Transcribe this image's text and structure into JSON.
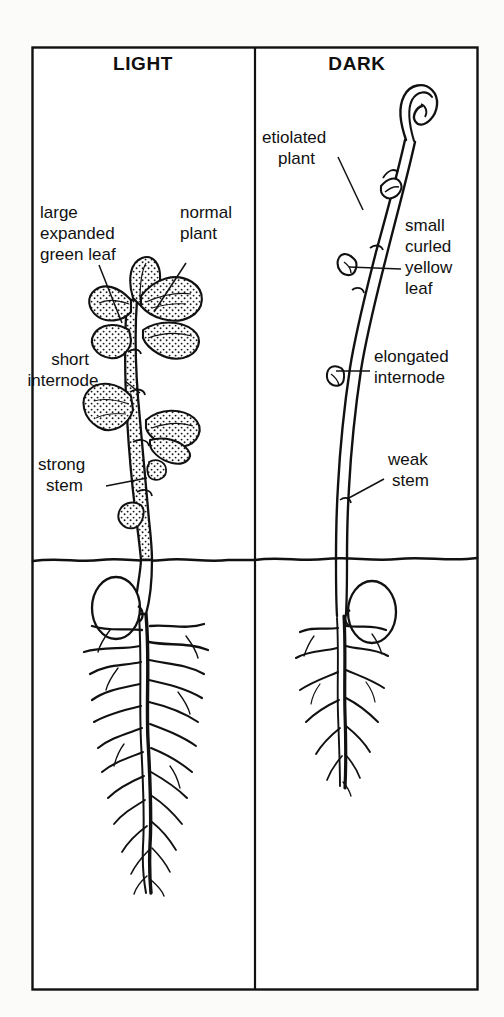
{
  "figure": {
    "background_color": "#fbfbfa",
    "ink_color": "#111111",
    "frame": {
      "x": 32,
      "y": 47,
      "width": 446,
      "height": 943
    },
    "divider_x": 255,
    "soil_line_y": 560
  },
  "panels": [
    {
      "id": "light",
      "header": "LIGHT",
      "header_x": 143,
      "header_y": 70,
      "plant_description": "normal green seedling with expanded leaves, short internodes, thick stem and extensive root system"
    },
    {
      "id": "dark",
      "header": "DARK",
      "header_x": 357,
      "header_y": 70,
      "plant_description": "etiolated seedling with apical hook, small curled leaves, elongated internodes, weak thin stem and reduced root system"
    }
  ],
  "labels": {
    "light": [
      {
        "name": "large-expanded-green-leaf",
        "lines": [
          "large",
          "expanded",
          "green leaf"
        ],
        "x": 40,
        "y": 218,
        "leader": {
          "x1": 99,
          "y1": 265,
          "x2": 122,
          "y2": 323
        }
      },
      {
        "name": "normal-plant",
        "lines": [
          "normal",
          "plant"
        ],
        "x": 180,
        "y": 218,
        "leader": {
          "x1": 186,
          "y1": 265,
          "x2": 154,
          "y2": 310
        }
      },
      {
        "name": "short-internode",
        "lines": [
          "short",
          "internode"
        ],
        "x": 34,
        "y": 365,
        "leader": {
          "x1": 126,
          "y1": 378,
          "x2": 142,
          "y2": 390
        }
      },
      {
        "name": "strong-stem",
        "lines": [
          "strong",
          "stem"
        ],
        "x": 38,
        "y": 470,
        "leader": {
          "x1": 106,
          "y1": 487,
          "x2": 146,
          "y2": 480
        }
      }
    ],
    "dark": [
      {
        "name": "etiolated-plant",
        "lines": [
          "etiolated",
          "plant"
        ],
        "x": 262,
        "y": 143,
        "leader": {
          "x1": 339,
          "y1": 158,
          "x2": 362,
          "y2": 208
        }
      },
      {
        "name": "small-curled-yellow-leaf",
        "lines": [
          "small",
          "curled",
          "yellow",
          "leaf"
        ],
        "x": 405,
        "y": 231,
        "leader": {
          "x1": 401,
          "y1": 270,
          "x2": 346,
          "y2": 268
        }
      },
      {
        "name": "elongated-internode",
        "lines": [
          "elongated",
          "internode"
        ],
        "x": 374,
        "y": 362,
        "leader": {
          "x1": 370,
          "y1": 372,
          "x2": 338,
          "y2": 372
        }
      },
      {
        "name": "weak-stem",
        "lines": [
          "weak",
          "stem"
        ],
        "x": 388,
        "y": 465,
        "leader": {
          "x1": 384,
          "y1": 480,
          "x2": 348,
          "y2": 497
        }
      }
    ]
  }
}
